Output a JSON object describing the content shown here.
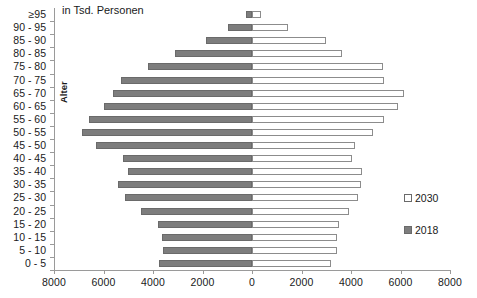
{
  "annotations": {
    "unit_note": "in Tsd. Personen",
    "y_axis_title": "Alter"
  },
  "legend": {
    "position": "right-middle",
    "items": [
      {
        "label": "2030",
        "color": "#ffffff",
        "style": "open-square"
      },
      {
        "label": "2018",
        "color": "#7d7d7d",
        "style": "filled-square"
      }
    ]
  },
  "chart_data": {
    "type": "bar",
    "subtype": "population-pyramid",
    "title": "",
    "subtitle": "in Tsd. Personen",
    "xlabel": "",
    "ylabel": "Alter",
    "grid": false,
    "legend_position": "right",
    "xlim": [
      -8000,
      8000
    ],
    "xticks": [
      -8000,
      -6000,
      -4000,
      -2000,
      0,
      2000,
      4000,
      6000,
      8000
    ],
    "xtick_labels": [
      "8000",
      "6000",
      "4000",
      "2000",
      "0",
      "2000",
      "4000",
      "6000",
      "8000"
    ],
    "categories": [
      "≥95",
      "90 - 95",
      "85 - 90",
      "80 - 85",
      "75 - 80",
      "70 - 75",
      "65 - 70",
      "60 - 65",
      "55 - 60",
      "50 - 55",
      "45 - 50",
      "40 - 45",
      "35 - 40",
      "30 - 35",
      "25 - 30",
      "20 - 25",
      "15 - 20",
      "10 - 15",
      "5 - 10",
      "0 - 5"
    ],
    "series": [
      {
        "name": "2018",
        "side": "left",
        "color": "#7d7d7d",
        "values": [
          250,
          950,
          1850,
          3100,
          4200,
          5300,
          5600,
          6000,
          6600,
          6850,
          6300,
          5200,
          5000,
          5400,
          5150,
          4500,
          3800,
          3650,
          3600,
          3750
        ]
      },
      {
        "name": "2030",
        "side": "right",
        "color": "#ffffff",
        "values": [
          350,
          1450,
          3000,
          3650,
          5300,
          5350,
          6150,
          5900,
          5350,
          4900,
          4150,
          4050,
          4450,
          4400,
          4300,
          3900,
          3500,
          3450,
          3450,
          3200
        ]
      }
    ]
  }
}
